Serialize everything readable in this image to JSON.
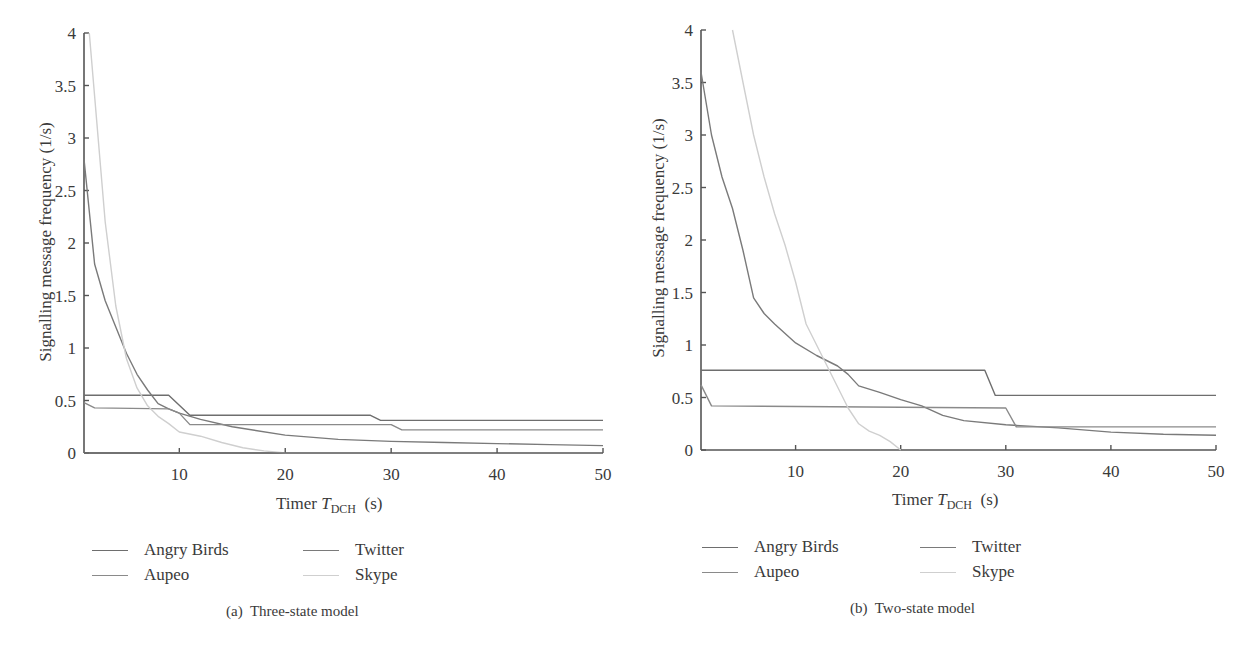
{
  "panels": [
    {
      "id": "a",
      "caption": "(a)  Three-state model",
      "ylabel": "Signalling message frequency (1/s)",
      "xlabel_prefix": "Timer ",
      "xlabel_var": "T",
      "xlabel_sub": "DCH",
      "xlabel_suffix": "  (s)",
      "legend": [
        "Angry Birds",
        "Twitter",
        "Aupeo",
        "Skype"
      ]
    },
    {
      "id": "b",
      "caption": "(b)  Two-state model",
      "ylabel": "Signalling message frequency (1/s)",
      "xlabel_prefix": "Timer ",
      "xlabel_var": "T",
      "xlabel_sub": "DCH",
      "xlabel_suffix": "  (s)",
      "legend": [
        "Angry Birds",
        "Twitter",
        "Aupeo",
        "Skype"
      ]
    }
  ],
  "series_colors": {
    "Angry Birds": "#6e6e6e",
    "Twitter": "#7a7a7a",
    "Aupeo": "#8a8a8a",
    "Skype": "#cfcfcf"
  },
  "chart_data": [
    {
      "type": "line",
      "title": "(a) Three-state model",
      "xlabel": "Timer T_DCH (s)",
      "ylabel": "Signalling message frequency (1/s)",
      "xlim": [
        1,
        50
      ],
      "ylim": [
        0,
        4
      ],
      "xticks": [
        10,
        20,
        30,
        40,
        50
      ],
      "yticks": [
        0,
        0.5,
        1,
        1.5,
        2,
        2.5,
        3,
        3.5,
        4
      ],
      "grid": false,
      "legend_position": "below",
      "series": [
        {
          "name": "Angry Birds",
          "x": [
            1,
            9,
            11,
            28,
            29,
            50
          ],
          "y": [
            0.55,
            0.55,
            0.36,
            0.36,
            0.31,
            0.31
          ]
        },
        {
          "name": "Twitter",
          "x": [
            1,
            2,
            3,
            4,
            5,
            6,
            7,
            8,
            9,
            10,
            12,
            15,
            20,
            25,
            30,
            35,
            40,
            45,
            50
          ],
          "y": [
            2.8,
            1.8,
            1.45,
            1.2,
            0.95,
            0.75,
            0.6,
            0.47,
            0.42,
            0.38,
            0.32,
            0.25,
            0.17,
            0.13,
            0.11,
            0.1,
            0.09,
            0.08,
            0.07
          ]
        },
        {
          "name": "Aupeo",
          "x": [
            1,
            2,
            9,
            10,
            11,
            30,
            31,
            50
          ],
          "y": [
            0.48,
            0.43,
            0.42,
            0.38,
            0.27,
            0.27,
            0.22,
            0.22
          ]
        },
        {
          "name": "Skype",
          "x": [
            1.5,
            2,
            3,
            4,
            5,
            6,
            7,
            8,
            9,
            10,
            12,
            14,
            16,
            18,
            20
          ],
          "y": [
            4.0,
            3.4,
            2.2,
            1.4,
            0.9,
            0.62,
            0.45,
            0.35,
            0.28,
            0.2,
            0.16,
            0.1,
            0.05,
            0.02,
            0.0
          ]
        },
        {
          "name": "Angry Birds (zero segment)",
          "x": [
            1,
            20
          ],
          "y": [
            0,
            0
          ]
        }
      ]
    },
    {
      "type": "line",
      "title": "(b) Two-state model",
      "xlabel": "Timer T_DCH (s)",
      "ylabel": "Signalling message frequency (1/s)",
      "xlim": [
        1,
        50
      ],
      "ylim": [
        0,
        4
      ],
      "xticks": [
        10,
        20,
        30,
        40,
        50
      ],
      "yticks": [
        0,
        0.5,
        1,
        1.5,
        2,
        2.5,
        3,
        3.5,
        4
      ],
      "grid": false,
      "legend_position": "below",
      "series": [
        {
          "name": "Angry Birds",
          "x": [
            1,
            28,
            29,
            50
          ],
          "y": [
            0.76,
            0.76,
            0.52,
            0.52
          ]
        },
        {
          "name": "Twitter",
          "x": [
            1,
            2,
            3,
            4,
            5,
            6,
            7,
            8,
            10,
            12,
            14,
            15,
            16,
            18,
            20,
            22,
            24,
            26,
            30,
            35,
            40,
            45,
            50
          ],
          "y": [
            3.6,
            3.0,
            2.6,
            2.3,
            1.9,
            1.45,
            1.3,
            1.2,
            1.02,
            0.9,
            0.8,
            0.72,
            0.61,
            0.55,
            0.48,
            0.42,
            0.33,
            0.28,
            0.24,
            0.21,
            0.17,
            0.15,
            0.14
          ]
        },
        {
          "name": "Aupeo",
          "x": [
            1,
            2,
            30,
            31,
            50
          ],
          "y": [
            0.62,
            0.42,
            0.4,
            0.22,
            0.22
          ]
        },
        {
          "name": "Skype",
          "x": [
            4,
            5,
            6,
            7,
            8,
            9,
            10,
            11,
            12,
            13,
            14,
            15,
            16,
            17,
            18,
            19,
            20
          ],
          "y": [
            4.0,
            3.5,
            3.0,
            2.6,
            2.25,
            1.95,
            1.6,
            1.2,
            1.0,
            0.8,
            0.6,
            0.4,
            0.25,
            0.18,
            0.14,
            0.08,
            0.0
          ]
        }
      ]
    }
  ]
}
